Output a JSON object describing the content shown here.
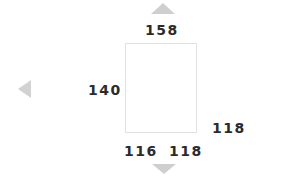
{
  "canvas": {
    "width": 291,
    "height": 178,
    "background": "#ffffff"
  },
  "measurement_box": {
    "name": "measurement-region",
    "border_color": "#e2e2e2",
    "fill_color": "#ffffff"
  },
  "dimensions": {
    "top": "158",
    "left": "140",
    "right": "118",
    "bottom_left": "116",
    "bottom_right": "118"
  },
  "arrows": {
    "color": "#cfcfcf",
    "up": "triangle-up-icon",
    "down": "triangle-down-icon",
    "left": "triangle-left-icon"
  },
  "text_style": {
    "color": "#2b2b2b"
  }
}
